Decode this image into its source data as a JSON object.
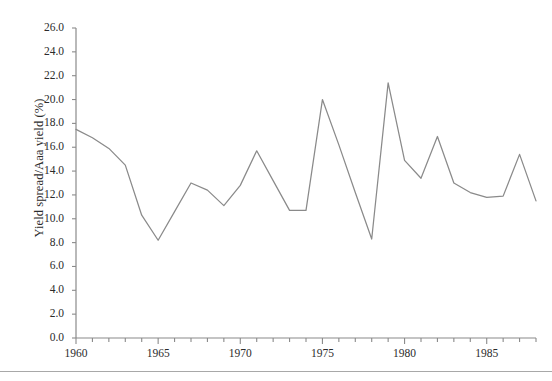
{
  "chart_data": {
    "type": "line",
    "title": "",
    "xlabel": "",
    "ylabel": "Yield spread/Aaa yield (%)",
    "xlim": [
      1960,
      1988
    ],
    "ylim": [
      0.0,
      26.0
    ],
    "grid": false,
    "legend": "none",
    "series_color": "#8a8a8a",
    "x_tick_labels": [
      "1960",
      "1965",
      "1970",
      "1975",
      "1980",
      "1985"
    ],
    "x_tick_values": [
      1960,
      1965,
      1970,
      1975,
      1980,
      1985
    ],
    "x_minor_tick_step": 1,
    "y_tick_labels": [
      "0.0",
      "2.0",
      "4.0",
      "6.0",
      "8.0",
      "10.0",
      "12.0",
      "14.0",
      "16.0",
      "18.0",
      "20.0",
      "22.0",
      "24.0",
      "26.0"
    ],
    "y_tick_values": [
      0.0,
      2.0,
      4.0,
      6.0,
      8.0,
      10.0,
      12.0,
      14.0,
      16.0,
      18.0,
      20.0,
      22.0,
      24.0,
      26.0
    ],
    "x": [
      1960,
      1961,
      1962,
      1963,
      1964,
      1965,
      1966,
      1967,
      1968,
      1969,
      1970,
      1971,
      1972,
      1973,
      1974,
      1975,
      1976,
      1977,
      1978,
      1979,
      1980,
      1981,
      1982,
      1983,
      1984,
      1985,
      1986,
      1987,
      1988
    ],
    "values": [
      17.5,
      16.8,
      15.9,
      14.5,
      10.3,
      8.2,
      10.6,
      13.0,
      12.4,
      11.1,
      12.8,
      15.7,
      13.2,
      10.7,
      10.7,
      20.0,
      16.2,
      12.2,
      8.3,
      21.4,
      14.9,
      13.4,
      16.9,
      13.0,
      12.2,
      11.8,
      11.9,
      15.4,
      11.5
    ],
    "series": [
      {
        "name": "Yield spread/Aaa yield (%)",
        "values": [
          17.5,
          16.8,
          15.9,
          14.5,
          10.3,
          8.2,
          10.6,
          13.0,
          12.4,
          11.1,
          12.8,
          15.7,
          13.2,
          10.7,
          10.7,
          20.0,
          16.2,
          12.2,
          8.3,
          21.4,
          14.9,
          13.4,
          16.9,
          13.0,
          12.2,
          11.8,
          11.9,
          15.4,
          11.5
        ]
      }
    ]
  },
  "axes": {
    "y_title": "Yield spread/Aaa yield (%)"
  }
}
